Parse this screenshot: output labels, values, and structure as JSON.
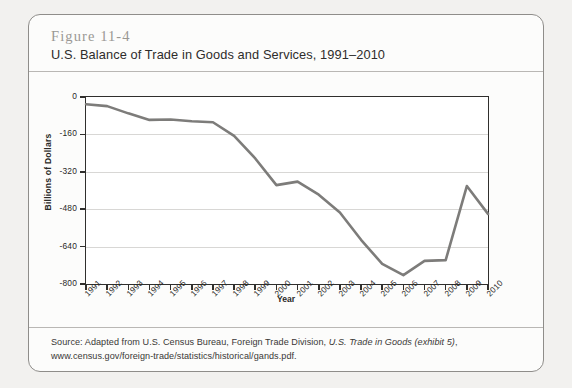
{
  "figure": {
    "number": "Figure 11-4",
    "title": "U.S. Balance of Trade in Goods and Services, 1991–2010"
  },
  "source": {
    "line1_prefix": "Source: Adapted from U.S. Census Bureau, Foreign Trade Division, ",
    "line1_italic": "U.S. Trade in Goods (exhibit 5)",
    "line1_suffix": ",",
    "line2": "www.census.gov/foreign-trade/statistics/historical/gands.pdf."
  },
  "chart_data": {
    "type": "line",
    "title": "U.S. Balance of Trade in Goods and Services, 1991–2010",
    "xlabel": "Year",
    "ylabel": "Billions of Dollars",
    "x": [
      1991,
      1992,
      1993,
      1994,
      1995,
      1996,
      1997,
      1998,
      1999,
      2000,
      2001,
      2002,
      2003,
      2004,
      2005,
      2006,
      2007,
      2008,
      2009,
      2010
    ],
    "xtick_labels": [
      "1991",
      "1992",
      "1993",
      "1994",
      "1995",
      "1996",
      "1997",
      "1998",
      "1999",
      "2000",
      "2001",
      "2002",
      "2003",
      "2004",
      "2005",
      "2006",
      "2007",
      "2008",
      "2009",
      "2010"
    ],
    "values": [
      -31,
      -39,
      -70,
      -98,
      -96,
      -104,
      -108,
      -166,
      -263,
      -377,
      -362,
      -418,
      -494,
      -611,
      -714,
      -762,
      -701,
      -698,
      -381,
      -500
    ],
    "ytick_labels": [
      "0",
      "-160",
      "-320",
      "-480",
      "-640",
      "-800"
    ],
    "yticks": [
      0,
      -160,
      -320,
      -480,
      -640,
      -800
    ],
    "ylim": [
      -800,
      0
    ],
    "xlim": [
      1991,
      2010
    ],
    "grid": true,
    "legend": null,
    "line_color": "#7d7c7a",
    "series": [
      {
        "name": "U.S. Balance of Trade in Goods and Services",
        "values": [
          -31,
          -39,
          -70,
          -98,
          -96,
          -104,
          -108,
          -166,
          -263,
          -377,
          -362,
          -418,
          -494,
          -611,
          -714,
          -762,
          -701,
          -698,
          -381,
          -500
        ]
      }
    ]
  }
}
